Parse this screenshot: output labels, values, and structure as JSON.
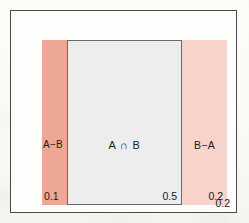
{
  "diagram": {
    "type": "set-partition-rectangle",
    "outer_frame": {
      "name": "universal-set-frame",
      "border_color": "#4a4a4c",
      "fill_color": "#fdfdfb"
    },
    "regions": [
      {
        "key": "a_minus_b",
        "label": "A−B",
        "value": "0.1",
        "fill_color": "#efa795"
      },
      {
        "key": "a_intersect_b",
        "label": "A ∩ B",
        "value": "0.5",
        "fill_color": "#ededee",
        "border_color": "#6a6a6d"
      },
      {
        "key": "b_minus_a",
        "label": "B−A",
        "value": "0.2",
        "fill_color": "#f7d3cb"
      }
    ],
    "outside": {
      "key": "complement",
      "label": "",
      "value": "0.2"
    }
  }
}
